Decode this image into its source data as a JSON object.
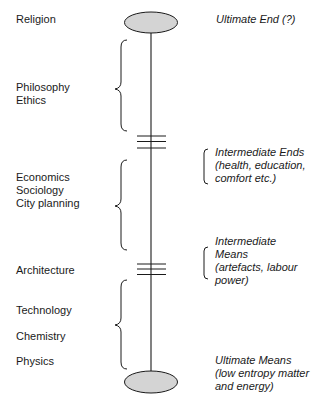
{
  "diagram": {
    "type": "means-ends spectrum",
    "colors": {
      "ellipse_fill": "#d4d4d4",
      "stroke": "#1a1a1a",
      "text": "#1a1a1a"
    },
    "left_labels": {
      "religion": "Religion",
      "philosophy": "Philosophy",
      "ethics": "Ethics",
      "economics": "Economics",
      "sociology": "Sociology",
      "city_planning": "City planning",
      "architecture": "Architecture",
      "technology": "Technology",
      "chemistry": "Chemistry",
      "physics": "Physics"
    },
    "right_labels": {
      "ultimate_end": "Ultimate End (?)",
      "intermediate_ends": [
        "Intermediate Ends",
        "(health, education,",
        "comfort etc.)"
      ],
      "intermediate_means": [
        "Intermediate",
        "Means",
        "(artefacts, labour",
        "power)"
      ],
      "ultimate_means": [
        "Ultimate Means",
        "(low entropy matter",
        "and energy)"
      ]
    }
  }
}
